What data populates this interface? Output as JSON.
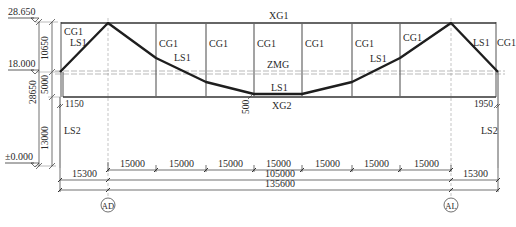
{
  "elevations": [
    {
      "label": "28.650",
      "y": 18
    },
    {
      "label": "18.000",
      "y": 70
    },
    {
      "label": "±0.000",
      "y": 163
    }
  ],
  "vertical_dims": {
    "outer": [
      {
        "label": "28650"
      }
    ],
    "inner": [
      {
        "label": "10650"
      },
      {
        "label": "5000"
      },
      {
        "label": "13000"
      }
    ]
  },
  "members": {
    "top_chord": "XG1",
    "bottom_chord": "XG2",
    "mid_beam": "ZMG",
    "post": "CG1",
    "truss": "LS1",
    "column": "LS2"
  },
  "labels": {
    "cg1_left_outer": "CG1",
    "ls1_left_outer": "LS1",
    "cg1_p1": "CG1",
    "ls1_p1": "LS1",
    "cg1_p2": "CG1",
    "cg1_p3": "CG1",
    "xg1": "XG1",
    "zmg": "ZMG",
    "ls1_mid": "LS1",
    "xg2": "XG2",
    "cg1_p4": "CG1",
    "cg1_p5": "CG1",
    "ls1_p5": "LS1",
    "cg1_p6": "CG1",
    "ls1_right_outer": "LS1",
    "cg1_right_outer": "CG1",
    "ls2_left": "LS2",
    "ls2_right": "LS2",
    "offset_left": "1150",
    "offset_right": "1950",
    "sag": "500"
  },
  "horizontal_dims": {
    "bays": [
      "15000",
      "15000",
      "15000",
      "15000",
      "15000",
      "15000",
      "15000"
    ],
    "left_overhang": "15300",
    "right_overhang": "15300",
    "main_span": "105000",
    "total": "135600"
  },
  "axes": [
    {
      "label": "AD"
    },
    {
      "label": "AL"
    }
  ],
  "colors": {
    "line": "#2a2a2a",
    "thick": "#1e1e1e",
    "grid": "#9a9a9a"
  }
}
